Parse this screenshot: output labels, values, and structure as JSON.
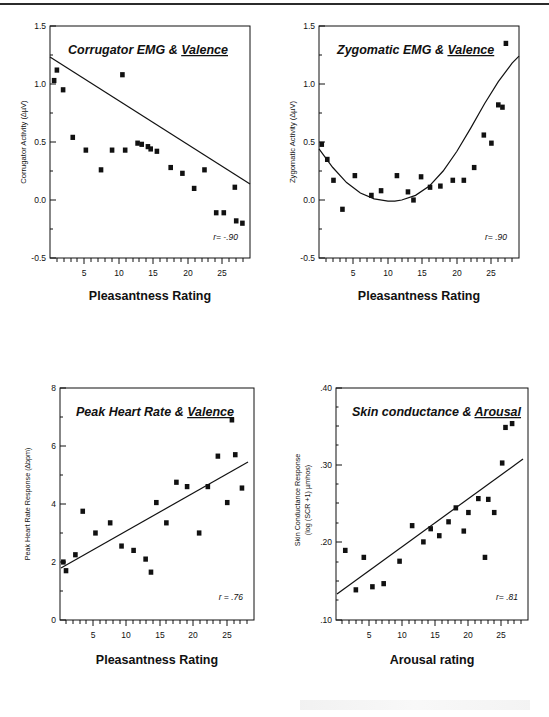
{
  "figure": {
    "background": "#ffffff",
    "ink": "#111111",
    "marker_color": "#111111",
    "line_color": "#111111",
    "panel_count": 4
  },
  "panels": [
    {
      "id": "corrugator-emg-valence",
      "title_plain": "Corrugator EMG & ",
      "title_underlined": "Valence",
      "r_label": "r= -.90",
      "chart_data": {
        "type": "scatter",
        "title": "Corrugator EMG & Valence",
        "xlabel": "Pleasantness Rating",
        "ylabel": "Corrugator Activity (∆µV)",
        "xlim": [
          0,
          29
        ],
        "ylim": [
          -0.5,
          1.5
        ],
        "xticks": [
          5,
          10,
          15,
          20,
          25
        ],
        "xticklabels": [
          "5",
          "10",
          "15",
          "20",
          "25"
        ],
        "yticks": [
          -0.5,
          0.0,
          0.5,
          1.0,
          1.5
        ],
        "yticklabels": [
          "-0.5",
          "0.0",
          "0.5",
          "1.0",
          "1.5"
        ],
        "grid": false,
        "legend": "none",
        "fit": "linear",
        "fit_endpoints": [
          [
            0,
            0.87
          ],
          [
            29,
            -0.22
          ]
        ],
        "points": [
          [
            0.6,
            1.03
          ],
          [
            1.0,
            1.12
          ],
          [
            1.9,
            0.95
          ],
          [
            3.3,
            0.54
          ],
          [
            5.2,
            0.43
          ],
          [
            7.4,
            0.26
          ],
          [
            9.0,
            0.43
          ],
          [
            10.5,
            1.08
          ],
          [
            10.9,
            0.43
          ],
          [
            12.7,
            0.49
          ],
          [
            13.3,
            0.48
          ],
          [
            14.2,
            0.46
          ],
          [
            14.6,
            0.44
          ],
          [
            15.5,
            0.42
          ],
          [
            17.5,
            0.28
          ],
          [
            19.2,
            0.23
          ],
          [
            20.9,
            0.1
          ],
          [
            22.4,
            0.26
          ],
          [
            24.1,
            -0.11
          ],
          [
            25.2,
            -0.11
          ],
          [
            26.8,
            0.11
          ],
          [
            27.0,
            -0.18
          ],
          [
            27.9,
            -0.2
          ]
        ]
      }
    },
    {
      "id": "zygomatic-emg-valence",
      "title_plain": "Zygomatic EMG & ",
      "title_underlined": "Valence",
      "r_label": "r= .90",
      "chart_data": {
        "type": "scatter",
        "title": "Zygomatic EMG & Valence",
        "xlabel": "Pleasantness Rating",
        "ylabel": "Zygomatic Activity (∆µV)",
        "xlim": [
          0,
          29
        ],
        "ylim": [
          -0.5,
          1.5
        ],
        "xticks": [
          5,
          10,
          15,
          20,
          25
        ],
        "xticklabels": [
          "5",
          "10",
          "15",
          "20",
          "25"
        ],
        "yticks": [
          -0.5,
          0.0,
          0.5,
          1.0,
          1.5
        ],
        "yticklabels": [
          "-0.5",
          "0.0",
          "0.5",
          "1.0",
          "1.5"
        ],
        "grid": false,
        "legend": "none",
        "fit": "quadratic",
        "fit_curve": [
          [
            0,
            0.44
          ],
          [
            2,
            0.28
          ],
          [
            4,
            0.15
          ],
          [
            6,
            0.06
          ],
          [
            8,
            0.01
          ],
          [
            10,
            -0.01
          ],
          [
            11,
            -0.01
          ],
          [
            12,
            0.0
          ],
          [
            14,
            0.04
          ],
          [
            16,
            0.12
          ],
          [
            18,
            0.25
          ],
          [
            20,
            0.42
          ],
          [
            22,
            0.62
          ],
          [
            24,
            0.83
          ],
          [
            26,
            1.02
          ],
          [
            28,
            1.18
          ],
          [
            29,
            1.24
          ]
        ],
        "points": [
          [
            0.4,
            0.48
          ],
          [
            1.2,
            0.35
          ],
          [
            2.1,
            0.17
          ],
          [
            3.4,
            -0.08
          ],
          [
            5.2,
            0.21
          ],
          [
            7.6,
            0.04
          ],
          [
            9.0,
            0.08
          ],
          [
            11.3,
            0.21
          ],
          [
            12.9,
            0.07
          ],
          [
            13.7,
            0.0
          ],
          [
            14.8,
            0.2
          ],
          [
            16.1,
            0.11
          ],
          [
            17.6,
            0.12
          ],
          [
            19.4,
            0.17
          ],
          [
            21.0,
            0.17
          ],
          [
            22.5,
            0.28
          ],
          [
            23.9,
            0.56
          ],
          [
            25.0,
            0.49
          ],
          [
            26.0,
            0.82
          ],
          [
            26.6,
            0.8
          ],
          [
            27.1,
            1.35
          ]
        ]
      }
    },
    {
      "id": "peak-heart-rate-valence",
      "title_plain": "Peak Heart Rate & ",
      "title_underlined": "Valence",
      "r_label": "r = .76",
      "chart_data": {
        "type": "scatter",
        "title": "Peak Heart Rate & Valence",
        "xlabel": "Pleasantness Rating",
        "ylabel": "Peak Heart Rate Response (∆bpm)",
        "xlim": [
          0,
          29
        ],
        "ylim": [
          0,
          8
        ],
        "xticks": [
          5,
          10,
          15,
          20,
          25
        ],
        "xticklabels": [
          "5",
          "10",
          "15",
          "20",
          "25"
        ],
        "yticks": [
          0,
          2,
          4,
          6,
          8
        ],
        "yticklabels": [
          "0",
          "2",
          "4",
          "6",
          "8"
        ],
        "grid": false,
        "legend": "none",
        "fit": "linear",
        "fit_endpoints": [
          [
            0,
            1.78
          ],
          [
            28.5,
            5.45
          ]
        ],
        "points": [
          [
            0.5,
            2.0
          ],
          [
            0.9,
            1.7
          ],
          [
            2.3,
            2.25
          ],
          [
            3.4,
            3.75
          ],
          [
            5.3,
            3.0
          ],
          [
            7.5,
            3.35
          ],
          [
            9.2,
            2.55
          ],
          [
            11.0,
            2.4
          ],
          [
            12.8,
            2.1
          ],
          [
            13.6,
            1.65
          ],
          [
            14.4,
            4.05
          ],
          [
            15.9,
            3.35
          ],
          [
            17.4,
            4.75
          ],
          [
            19.0,
            4.6
          ],
          [
            20.8,
            3.0
          ],
          [
            22.1,
            4.6
          ],
          [
            23.6,
            5.65
          ],
          [
            25.0,
            4.05
          ],
          [
            25.7,
            6.9
          ],
          [
            26.2,
            5.7
          ],
          [
            27.2,
            4.55
          ]
        ]
      }
    },
    {
      "id": "skin-conductance-arousal",
      "title_plain": "Skin conductance & ",
      "title_underlined": "Arousal",
      "r_label": "r= .81",
      "chart_data": {
        "type": "scatter",
        "title": "Skin conductance & Arousal",
        "xlabel": "Arousal rating",
        "ylabel": "Skin Conductance Response (log (SCR +1) µmhos)",
        "xlim": [
          0,
          29
        ],
        "ylim": [
          0.1,
          0.4
        ],
        "xticks": [
          5,
          10,
          15,
          20,
          25
        ],
        "xticklabels": [
          "5",
          "10",
          "15",
          "20",
          "25"
        ],
        "yticks": [
          0.1,
          0.2,
          0.3,
          0.4
        ],
        "yticklabels": [
          ".10",
          ".20",
          ".30",
          ".40"
        ],
        "grid": false,
        "legend": "none",
        "fit": "linear",
        "fit_endpoints": [
          [
            0,
            0.133
          ],
          [
            28.5,
            0.307
          ]
        ],
        "points": [
          [
            1.4,
            0.19
          ],
          [
            3.0,
            0.139
          ],
          [
            4.2,
            0.181
          ],
          [
            5.5,
            0.143
          ],
          [
            7.2,
            0.147
          ],
          [
            9.6,
            0.176
          ],
          [
            11.5,
            0.222
          ],
          [
            13.2,
            0.201
          ],
          [
            14.3,
            0.218
          ],
          [
            15.6,
            0.209
          ],
          [
            17.0,
            0.227
          ],
          [
            18.1,
            0.245
          ],
          [
            19.3,
            0.215
          ],
          [
            20.0,
            0.239
          ],
          [
            21.5,
            0.257
          ],
          [
            22.5,
            0.181
          ],
          [
            23.0,
            0.256
          ],
          [
            23.9,
            0.239
          ],
          [
            25.1,
            0.303
          ],
          [
            25.6,
            0.349
          ],
          [
            26.6,
            0.354
          ]
        ]
      }
    }
  ]
}
